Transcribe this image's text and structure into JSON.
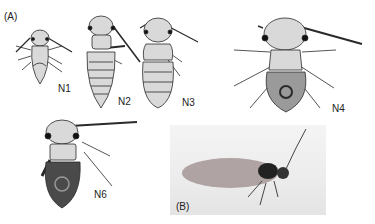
{
  "figure": {
    "panel_a_label": "(A)",
    "panel_b_label": "(B)",
    "stages": [
      {
        "label": "N1"
      },
      {
        "label": "N2"
      },
      {
        "label": "N3"
      },
      {
        "label": "N4"
      },
      {
        "label": "N6"
      }
    ],
    "colors": {
      "ink": "#2a2a2a",
      "fill": "#d9d9d9",
      "dark_fill": "#555555",
      "photo_bg": "#ececec"
    }
  }
}
